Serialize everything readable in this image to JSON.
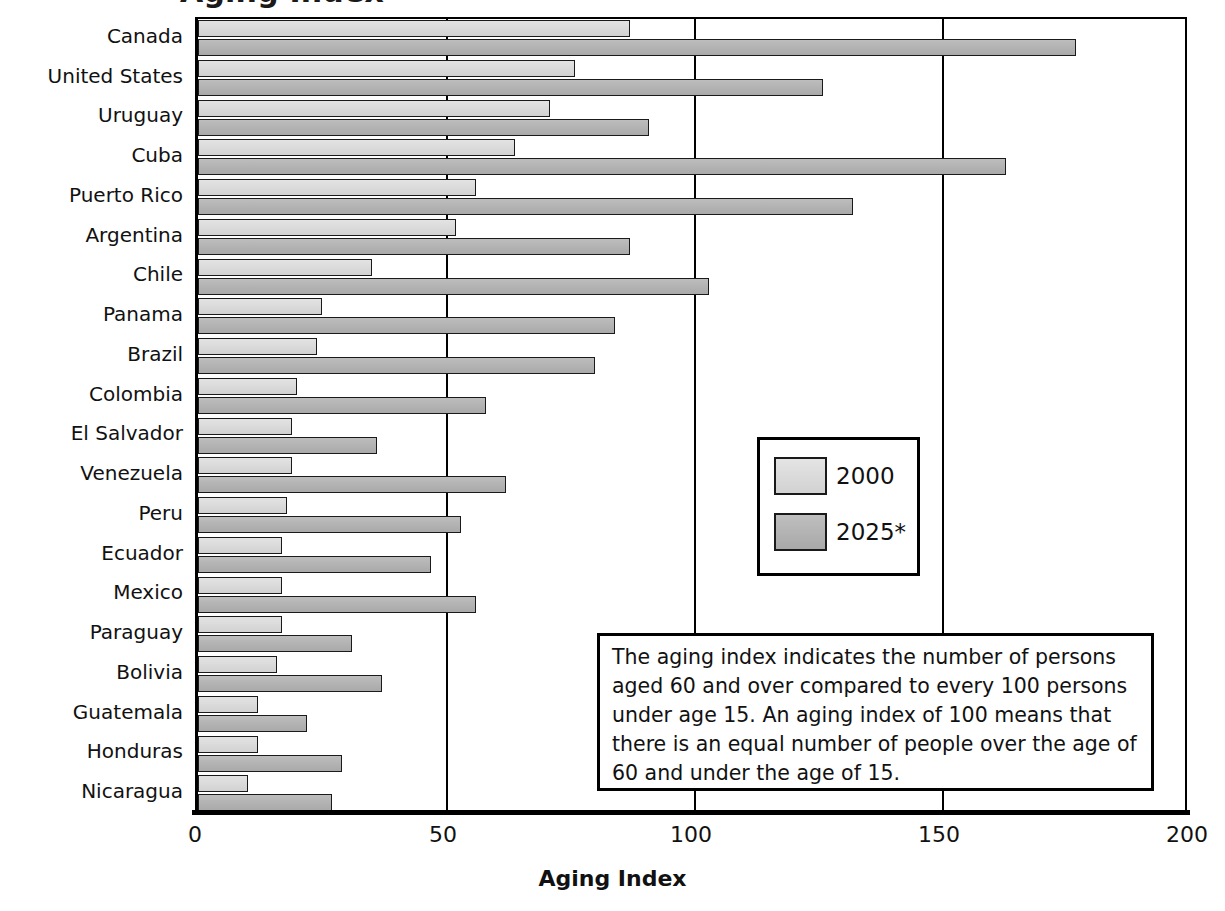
{
  "chart_data": {
    "type": "bar",
    "orientation": "horizontal",
    "title": "",
    "xlabel": "Aging Index",
    "ylabel": "",
    "xlim": [
      0,
      200
    ],
    "xticks": [
      0,
      50,
      100,
      150,
      200
    ],
    "grid": "vertical gridlines at 50, 100, 150",
    "legend_position": "center-right inside plot",
    "categories": [
      "Canada",
      "United States",
      "Uruguay",
      "Cuba",
      "Puerto Rico",
      "Argentina",
      "Chile",
      "Panama",
      "Brazil",
      "Colombia",
      "El Salvador",
      "Venezuela",
      "Peru",
      "Ecuador",
      "Mexico",
      "Paraguay",
      "Bolivia",
      "Guatemala",
      "Honduras",
      "Nicaragua"
    ],
    "series": [
      {
        "name": "2000",
        "values": [
          87,
          76,
          71,
          64,
          56,
          52,
          35,
          25,
          24,
          20,
          19,
          19,
          18,
          17,
          17,
          17,
          16,
          12,
          12,
          10
        ]
      },
      {
        "name": "2025*",
        "values": [
          177,
          126,
          91,
          163,
          132,
          87,
          103,
          84,
          80,
          58,
          36,
          62,
          53,
          47,
          56,
          31,
          37,
          22,
          29,
          27
        ]
      }
    ],
    "annotation": "The aging index indicates the number of persons aged 60 and over compared to every 100 persons under age 15. An aging index of 100 means that there is an equal number of people over the age of 60 and under the age of 15."
  },
  "chart": {
    "title_sliver": "Aging Index",
    "xlabel": "Aging Index",
    "xticks": [
      "0",
      "50",
      "100",
      "150",
      "200"
    ],
    "gridlines": [
      50,
      100,
      150
    ]
  },
  "legend": {
    "items": [
      {
        "label": "2000",
        "swatch": "light-gray"
      },
      {
        "label": "2025*",
        "swatch": "dark-gray"
      }
    ]
  },
  "note": {
    "text": "The aging index indicates the number of persons aged 60 and over compared to every 100 persons under age 15. An aging index of 100 means that there is an equal number of people over the age of 60 and under the age of 15."
  }
}
